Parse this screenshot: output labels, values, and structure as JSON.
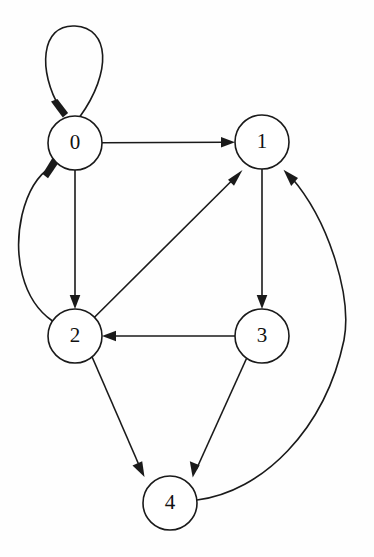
{
  "diagram": {
    "type": "directed-graph",
    "background_color": "#fefefe",
    "stroke_color": "#1a1a1a",
    "node_fill_color": "#ffffff",
    "node_radius": 27,
    "nodes": [
      {
        "id": "0",
        "label": "0",
        "cx": 75,
        "cy": 143
      },
      {
        "id": "1",
        "label": "1",
        "cx": 262,
        "cy": 142
      },
      {
        "id": "2",
        "label": "2",
        "cx": 75,
        "cy": 336
      },
      {
        "id": "3",
        "label": "3",
        "cx": 262,
        "cy": 336
      },
      {
        "id": "4",
        "label": "4",
        "cx": 170,
        "cy": 503
      }
    ],
    "edges": [
      {
        "from": "0",
        "to": "0",
        "kind": "self-loop",
        "directed": true
      },
      {
        "from": "0",
        "to": "1",
        "kind": "straight",
        "directed": true
      },
      {
        "from": "0",
        "to": "2",
        "kind": "straight",
        "directed": true
      },
      {
        "from": "2",
        "to": "0",
        "kind": "curve-left",
        "directed": true
      },
      {
        "from": "2",
        "to": "1",
        "kind": "straight",
        "directed": true
      },
      {
        "from": "2",
        "to": "4",
        "kind": "straight",
        "directed": true
      },
      {
        "from": "1",
        "to": "3",
        "kind": "straight",
        "directed": true
      },
      {
        "from": "3",
        "to": "2",
        "kind": "straight",
        "directed": true
      },
      {
        "from": "3",
        "to": "4",
        "kind": "straight",
        "directed": true
      },
      {
        "from": "4",
        "to": "1",
        "kind": "curve-right",
        "directed": true
      }
    ]
  }
}
